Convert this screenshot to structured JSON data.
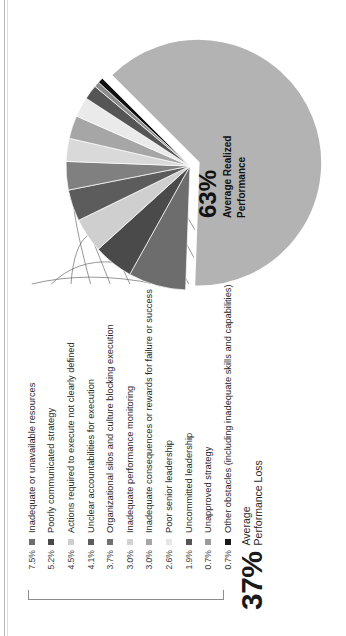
{
  "headline": {
    "value": "37%",
    "line1": "Average",
    "line2": "Performance Loss"
  },
  "pie_center": {
    "value": "63%",
    "line1": "Average Realized",
    "line2": "Performance"
  },
  "chart_data": {
    "type": "pie",
    "title": "37% Average Performance Loss",
    "center_label": "63% Average Realized Performance",
    "legend_position": "left",
    "grid": false,
    "categories": [
      "Average Realized Performance",
      "Inadequate or unavailable resources",
      "Poorly communicated strategy",
      "Actions required to execute not clearly defined",
      "Unclear accountabilities for execution",
      "Organizational silos and culture blocking execution",
      "Inadequate performance monitoring",
      "Inadequate consequences or rewards for failure or success",
      "Poor senior leadership",
      "Uncommitted leadership",
      "Unapproved strategy",
      "Other obstacles (including inadequate skills and capabilities)"
    ],
    "values": [
      63.0,
      7.5,
      5.2,
      4.5,
      4.1,
      3.7,
      3.0,
      3.0,
      2.6,
      1.9,
      0.7,
      0.7
    ],
    "labels": [
      "63%",
      "7.5%",
      "5.2%",
      "4.5%",
      "4.1%",
      "3.7%",
      "3.0%",
      "3.0%",
      "2.6%",
      "1.9%",
      "0.7%",
      "0.7%"
    ],
    "colors": [
      "#b3b3b3",
      "#6d6d6d",
      "#4a4a4a",
      "#cfcfcf",
      "#5c5c5c",
      "#808080",
      "#d9d9d9",
      "#a6a6a6",
      "#eaeaea",
      "#555555",
      "#8c8c8c",
      "#111111"
    ]
  },
  "legend": {
    "items": [
      {
        "pct": "7.5%",
        "label": "Inadequate or unavailable resources",
        "color": "#6d6d6d"
      },
      {
        "pct": "5.2%",
        "label": "Poorly communicated strategy",
        "color": "#4a4a4a"
      },
      {
        "pct": "4.5%",
        "label": "Actions required to execute not clearly defined",
        "color": "#cfcfcf"
      },
      {
        "pct": "4.1%",
        "label": "Unclear accountabilities for execution",
        "color": "#5c5c5c"
      },
      {
        "pct": "3.7%",
        "label": "Organizational silos and culture blocking execution",
        "color": "#707070"
      },
      {
        "pct": "3.0%",
        "label": "Inadequate performance monitoring",
        "color": "#d2d2d2"
      },
      {
        "pct": "3.0%",
        "label": "Inadequate consequences or rewards for failure or success",
        "color": "#a6a6a6"
      },
      {
        "pct": "2.6%",
        "label": "Poor senior leadership",
        "color": "#e6e6e6"
      },
      {
        "pct": "1.9%",
        "label": "Uncommitted leadership",
        "color": "#555555"
      },
      {
        "pct": "0.7%",
        "label": "Unapproved strategy",
        "color": "#9a9a9a"
      },
      {
        "pct": "0.7%",
        "label": "Other obstacles (including inadequate skills and capabilities)",
        "color": "#1a1a1a"
      }
    ]
  }
}
